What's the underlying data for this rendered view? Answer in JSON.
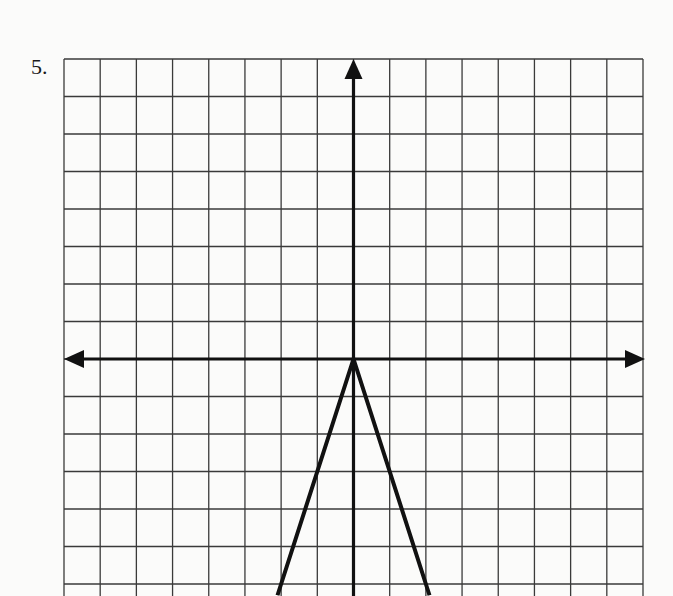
{
  "problem": {
    "number_label": "5."
  },
  "colors": {
    "grid": "#3a3a3a",
    "axis": "#111111",
    "curve": "#111111",
    "paper": "#fbfbfa"
  },
  "chart_data": {
    "type": "line",
    "title": "",
    "xlabel": "",
    "ylabel": "",
    "grid": true,
    "xlim": [
      -8,
      8
    ],
    "ylim": [
      -6.5,
      8
    ],
    "grid_cells": {
      "columns": 16,
      "rows_visible": 14.5
    },
    "axes": {
      "x_arrows": true,
      "y_arrows": "top-only-visible"
    },
    "series": [
      {
        "name": "y = -3|x|",
        "points": [
          [
            -2.1,
            -6.3
          ],
          [
            0,
            0
          ],
          [
            2.1,
            -6.3
          ]
        ],
        "description": "Inverted V (absolute value) with vertex at origin, opening downward, slope ±3"
      }
    ]
  }
}
